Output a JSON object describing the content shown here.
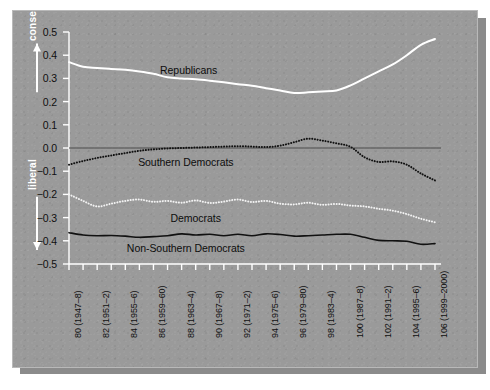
{
  "figure": {
    "panel_bg": "#9a9a9a",
    "shadow_color": "#8b8b8b",
    "border_color": "#b9b9b9"
  },
  "axis_annotations": {
    "conservative": "conservative",
    "liberal": "liberal",
    "up_arrow_icon": "up-arrow-icon",
    "down_arrow_icon": "down-arrow-icon"
  },
  "chart_data": {
    "type": "line",
    "title": "",
    "subtitle": "",
    "xlabel": "",
    "ylabel": "",
    "ylim": [
      -0.5,
      0.5
    ],
    "yticks": [
      0.5,
      0.4,
      0.3,
      0.2,
      0.1,
      0.0,
      -0.1,
      -0.2,
      -0.3,
      -0.4,
      -0.5
    ],
    "ytick_labels": [
      "0.5",
      "0.4",
      "0.3",
      "0.2",
      "0.1",
      "0.0",
      "-0.1",
      "-0.2",
      "-0.3",
      "-0.4",
      "-0.5"
    ],
    "grid": false,
    "legend": "inline-labels",
    "zero_line": 0.0,
    "x": [
      80,
      81,
      82,
      83,
      84,
      85,
      86,
      87,
      88,
      89,
      90,
      91,
      92,
      93,
      94,
      95,
      96,
      97,
      98,
      99,
      100,
      101,
      102,
      103,
      104,
      105,
      106
    ],
    "xtick_labels": [
      "80 (1947–8)",
      "82 (1951–2)",
      "84 (1955–6)",
      "86 (1959–60)",
      "88 (1963–4)",
      "90 (1967–8)",
      "92 (1971–2)",
      "94 (1975–6)",
      "96 (1979–80)",
      "98 (1983–4)",
      "100 (1987–8)",
      "102 (1991–2)",
      "104 (1995–6)",
      "106 (1999–2000)"
    ],
    "xtick_label_congresses": [
      80,
      82,
      84,
      86,
      88,
      90,
      92,
      94,
      96,
      98,
      100,
      102,
      104,
      106
    ],
    "series": [
      {
        "name": "Republicans",
        "label": "Republicans",
        "color": "#ffffff",
        "style": "solid",
        "width": 2.0,
        "label_pos": {
          "congress": 88.5,
          "value": 0.335
        },
        "values": [
          0.37,
          0.35,
          0.345,
          0.341,
          0.337,
          0.33,
          0.32,
          0.305,
          0.3,
          0.296,
          0.29,
          0.283,
          0.275,
          0.268,
          0.258,
          0.248,
          0.237,
          0.24,
          0.244,
          0.248,
          0.27,
          0.3,
          0.33,
          0.36,
          0.4,
          0.445,
          0.47
        ]
      },
      {
        "name": "Southern Democrats",
        "label": "Southern Democrats",
        "color": "#111111",
        "style": "dotted",
        "width": 2.0,
        "label_pos": {
          "congress": 88.3,
          "value": -0.06
        },
        "values": [
          -0.072,
          -0.056,
          -0.043,
          -0.032,
          -0.022,
          -0.012,
          -0.006,
          -0.002,
          0.0,
          0.002,
          0.004,
          0.006,
          0.008,
          0.006,
          0.004,
          0.01,
          0.025,
          0.04,
          0.032,
          0.02,
          0.005,
          -0.04,
          -0.06,
          -0.058,
          -0.072,
          -0.11,
          -0.14
        ]
      },
      {
        "name": "Democrats",
        "label": "Democrats",
        "color": "#f2f2f2",
        "style": "dotted",
        "width": 2.0,
        "label_pos": {
          "congress": 89.0,
          "value": -0.3
        },
        "values": [
          -0.2,
          -0.228,
          -0.252,
          -0.24,
          -0.228,
          -0.222,
          -0.232,
          -0.228,
          -0.236,
          -0.226,
          -0.237,
          -0.231,
          -0.222,
          -0.233,
          -0.228,
          -0.24,
          -0.243,
          -0.236,
          -0.245,
          -0.241,
          -0.248,
          -0.252,
          -0.262,
          -0.27,
          -0.285,
          -0.305,
          -0.32
        ]
      },
      {
        "name": "Non-Southern Democrats",
        "label": "Non-Southern Democrats",
        "color": "#111111",
        "style": "solid",
        "width": 1.6,
        "label_pos": {
          "congress": 88.3,
          "value": -0.43
        },
        "values": [
          -0.365,
          -0.375,
          -0.378,
          -0.377,
          -0.38,
          -0.385,
          -0.382,
          -0.378,
          -0.37,
          -0.375,
          -0.372,
          -0.378,
          -0.372,
          -0.378,
          -0.37,
          -0.373,
          -0.38,
          -0.378,
          -0.375,
          -0.372,
          -0.372,
          -0.385,
          -0.398,
          -0.4,
          -0.402,
          -0.415,
          -0.412
        ]
      }
    ]
  }
}
